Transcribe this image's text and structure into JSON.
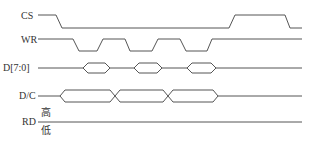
{
  "diagram": {
    "type": "timing-diagram",
    "line_color": "#555555",
    "text_color": "#333333",
    "signals": [
      {
        "name": "CS",
        "kind": "digital",
        "label_pos": [
          21,
          12
        ]
      },
      {
        "name": "WR",
        "kind": "digital",
        "label_pos": [
          22,
          36
        ]
      },
      {
        "name": "D[7:0]",
        "kind": "bus",
        "label_pos": [
          4,
          63
        ]
      },
      {
        "name": "D/C",
        "kind": "bus",
        "label_pos": [
          19,
          91
        ]
      },
      {
        "name": "RD",
        "kind": "digital-static",
        "label_pos": [
          22,
          117
        ]
      }
    ],
    "rd_levels": {
      "high": "高",
      "low": "低"
    },
    "waveforms": {
      "CS": "M38,15 L56,15 L62,28 L229,28 L235,15 L285,15 L290,28 L302,28",
      "WR": "M38,39 L73,39 L79,51 L97,51 L103,39 L125,39 L130,51 L152,51 L158,39 L180,39 L186,51 L207,51 L212,39 L302,39",
      "D70_base": "M38,68 L83,68 M110,68 L134,68 M162,68 L187,68 M216,68 L302,68",
      "D70_eyes": [
        "M83,68 L88,63 L105,63 L110,68 L105,73 L88,73 Z",
        "M134,68 L139,63 L157,63 L162,68 L157,73 L139,73 Z",
        "M187,68 L192,63 L211,63 L216,68 L211,73 L192,73 Z"
      ],
      "DC_base": "M38,96 L60,96 M218,96 L302,96",
      "DC_eyes": [
        "M60,96 L65,90 L110,90 L115,96 L110,102 L65,102 Z",
        "M115,96 L120,90 L163,90 L168,96 L163,102 L120,102 Z",
        "M168,96 L173,90 L213,90 L218,96 L213,102 L173,102 Z"
      ],
      "RD": "M38,122 L302,122"
    }
  }
}
